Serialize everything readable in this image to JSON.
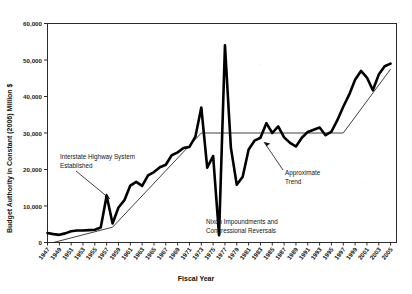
{
  "chart_data": {
    "type": "line",
    "title": "",
    "xlabel": "Fiscal Year",
    "ylabel": "Budget Authority in Constant (2006) Million $",
    "xlim": [
      1947,
      2006
    ],
    "ylim": [
      0,
      60000
    ],
    "grid": false,
    "legend_position": "none",
    "ytick_labels": [
      "0",
      "10,000",
      "20,000",
      "30,000",
      "40,000",
      "50,000",
      "60,000"
    ],
    "ytick_values": [
      0,
      10000,
      20000,
      30000,
      40000,
      50000,
      60000
    ],
    "xtick_labels": [
      "1947",
      "1949",
      "1951",
      "1953",
      "1955",
      "1957",
      "1959",
      "1961",
      "1963",
      "1965",
      "1967",
      "1969",
      "1971",
      "1973",
      "1975",
      "1977",
      "1979",
      "1981",
      "1983",
      "1985",
      "1987",
      "1989",
      "1991",
      "1993",
      "1995",
      "1997",
      "1999",
      "2001",
      "2003",
      "2005"
    ],
    "series": [
      {
        "name": "Budget Authority",
        "x": [
          1947,
          1948,
          1949,
          1950,
          1951,
          1952,
          1953,
          1954,
          1955,
          1956,
          1957,
          1958,
          1959,
          1960,
          1961,
          1962,
          1963,
          1964,
          1965,
          1966,
          1967,
          1968,
          1969,
          1970,
          1971,
          1972,
          1973,
          1974,
          1975,
          1976,
          1977,
          1978,
          1979,
          1980,
          1981,
          1982,
          1983,
          1984,
          1985,
          1986,
          1987,
          1988,
          1989,
          1990,
          1991,
          1992,
          1993,
          1994,
          1995,
          1996,
          1997,
          1998,
          1999,
          2000,
          2001,
          2002,
          2003,
          2004,
          2005
        ],
        "values": [
          2600,
          2300,
          2100,
          2500,
          3100,
          3300,
          3300,
          3400,
          3500,
          4100,
          12800,
          5200,
          9600,
          11600,
          15600,
          16600,
          15500,
          18400,
          19300,
          20600,
          21300,
          23900,
          24700,
          25900,
          26200,
          29000,
          37000,
          20500,
          23700,
          2000,
          54000,
          26000,
          15800,
          18000,
          25500,
          27900,
          28700,
          32700,
          30000,
          31800,
          28800,
          27300,
          26300,
          28700,
          30300,
          30900,
          31500,
          29400,
          30400,
          33500,
          37200,
          40500,
          44600,
          47000,
          45200,
          41700,
          46000,
          48300,
          49000
        ]
      }
    ],
    "trend": {
      "name": "Approximate Trend",
      "x": [
        1948,
        1958,
        1973,
        1997,
        2005
      ],
      "values": [
        0,
        4200,
        30000,
        30000,
        47500
      ]
    },
    "annotations": [
      {
        "name": "interstate-highway",
        "text_line1": "Interstate Highway System",
        "text_line2": "Established"
      },
      {
        "name": "nixon-impoundments",
        "text_line1": "Nixon Impoundments and",
        "text_line2": "Congressional Reversals"
      },
      {
        "name": "approximate-trend",
        "text_line1": "Approximate",
        "text_line2": "Trend"
      }
    ]
  },
  "colors": {
    "data_line": "#000000",
    "trend_line": "#1f1f1f",
    "axis": "#2b2b2b",
    "background": "#ffffff"
  }
}
